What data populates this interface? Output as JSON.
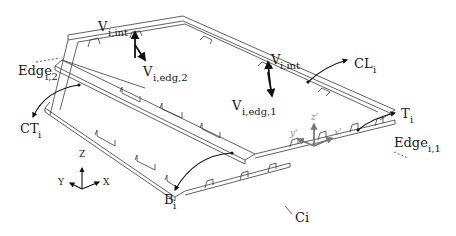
{
  "figure": {
    "labels": {
      "v_int_left": {
        "main": "V",
        "sub": "i,int"
      },
      "v_edg_2": {
        "main": "V",
        "sub": "i,edg,2"
      },
      "v_int_right": {
        "main": "V",
        "sub": "i,int"
      },
      "v_edg_1": {
        "main": "V",
        "sub": "i,edg,1"
      },
      "cl": {
        "main": "CL",
        "sub": "i"
      },
      "t": {
        "main": "T",
        "sub": "i"
      },
      "edge_1": {
        "main": "Edge",
        "sub": "i,1"
      },
      "edge_2": {
        "main": "Edge",
        "sub": "i,2"
      },
      "ct": {
        "main": "CT",
        "sub": "i"
      },
      "b": {
        "main": "B",
        "sub": "i"
      },
      "c": {
        "main": "Ci"
      }
    },
    "global_axes": {
      "z": "Z",
      "y": "Y",
      "x": "X"
    },
    "local_axes": {
      "z": "z'",
      "y": "y'",
      "x": "x'"
    },
    "colors": {
      "line": "#3a3a3a",
      "text": "#1a1a1a",
      "local_axes": "#777777"
    }
  }
}
